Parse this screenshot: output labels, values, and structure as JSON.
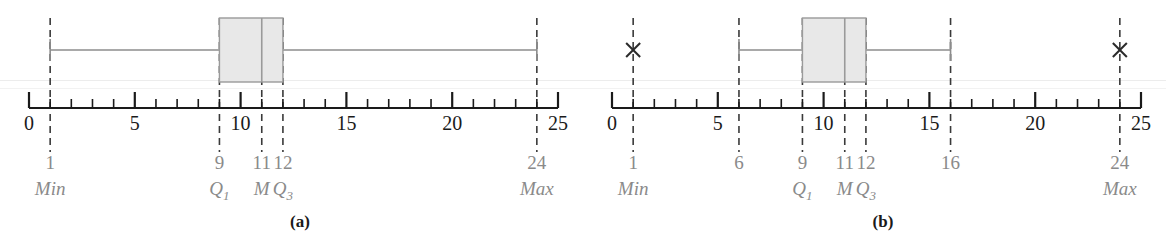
{
  "figure": {
    "type": "boxplot-pair-diagram",
    "panels": [
      {
        "id": "a",
        "caption": "(a)",
        "axis": {
          "min": 0,
          "max": 25,
          "tick_step": 1,
          "major_tick_step": 5,
          "tick_labels": [
            "0",
            "5",
            "10",
            "15",
            "20",
            "25"
          ],
          "tick_label_values": [
            0,
            5,
            10,
            15,
            20,
            25
          ]
        },
        "markers": [
          {
            "value": 1,
            "number_label": "1",
            "name_label": "Min",
            "name_label_html": "Min"
          },
          {
            "value": 9,
            "number_label": "9",
            "name_label": "Q1",
            "name_label_html": "Q<sub>1</sub>"
          },
          {
            "value": 11,
            "number_label": "11",
            "name_label": "M",
            "name_label_html": "M"
          },
          {
            "value": 12,
            "number_label": "12",
            "name_label": "Q3",
            "name_label_html": "Q<sub>3</sub>"
          },
          {
            "value": 24,
            "number_label": "24",
            "name_label": "Max",
            "name_label_html": "Max"
          }
        ],
        "box": {
          "q1": 9,
          "median": 11,
          "q3": 12
        },
        "whiskers": {
          "low": 1,
          "high": 24
        },
        "outliers": []
      },
      {
        "id": "b",
        "caption": "(b)",
        "axis": {
          "min": 0,
          "max": 25,
          "tick_step": 1,
          "major_tick_step": 5,
          "tick_labels": [
            "0",
            "5",
            "10",
            "15",
            "20",
            "25"
          ],
          "tick_label_values": [
            0,
            5,
            10,
            15,
            20,
            25
          ]
        },
        "markers": [
          {
            "value": 1,
            "number_label": "1",
            "name_label": "Min",
            "name_label_html": "Min"
          },
          {
            "value": 6,
            "number_label": "6",
            "name_label": "",
            "name_label_html": ""
          },
          {
            "value": 9,
            "number_label": "9",
            "name_label": "Q1",
            "name_label_html": "Q<sub>1</sub>"
          },
          {
            "value": 11,
            "number_label": "11",
            "name_label": "M",
            "name_label_html": "M"
          },
          {
            "value": 12,
            "number_label": "12",
            "name_label": "Q3",
            "name_label_html": "Q<sub>3</sub>"
          },
          {
            "value": 16,
            "number_label": "16",
            "name_label": "",
            "name_label_html": ""
          },
          {
            "value": 24,
            "number_label": "24",
            "name_label": "Max",
            "name_label_html": "Max"
          }
        ],
        "box": {
          "q1": 9,
          "median": 11,
          "q3": 12
        },
        "whiskers": {
          "low": 6,
          "high": 16
        },
        "outliers": [
          {
            "value": 1,
            "glyph": "x-marker"
          },
          {
            "value": 24,
            "glyph": "x-marker"
          }
        ]
      }
    ]
  },
  "chart_data": {
    "type": "boxplot",
    "title": "",
    "xlabel": "",
    "ylabel": "",
    "xlim": [
      0,
      25
    ],
    "grid": false,
    "legend": "none",
    "series": [
      {
        "name": "(a)",
        "min": 1,
        "q1": 9,
        "median": 11,
        "q3": 12,
        "max": 24,
        "whisker_low": 1,
        "whisker_high": 24,
        "outliers": [],
        "annotations": [
          {
            "value": 1,
            "number": "1",
            "label": "Min"
          },
          {
            "value": 9,
            "number": "9",
            "label": "Q1"
          },
          {
            "value": 11,
            "number": "11",
            "label": "M"
          },
          {
            "value": 12,
            "number": "12",
            "label": "Q3"
          },
          {
            "value": 24,
            "number": "24",
            "label": "Max"
          }
        ]
      },
      {
        "name": "(b)",
        "min": 1,
        "q1": 9,
        "median": 11,
        "q3": 12,
        "max": 24,
        "whisker_low": 6,
        "whisker_high": 16,
        "outliers": [
          1,
          24
        ],
        "annotations": [
          {
            "value": 1,
            "number": "1",
            "label": "Min"
          },
          {
            "value": 6,
            "number": "6",
            "label": ""
          },
          {
            "value": 9,
            "number": "9",
            "label": "Q1"
          },
          {
            "value": 11,
            "number": "11",
            "label": "M"
          },
          {
            "value": 12,
            "number": "12",
            "label": "Q3"
          },
          {
            "value": 16,
            "number": "16",
            "label": ""
          },
          {
            "value": 24,
            "number": "24",
            "label": "Max"
          }
        ]
      }
    ],
    "axis_ticks": [
      0,
      1,
      2,
      3,
      4,
      5,
      6,
      7,
      8,
      9,
      10,
      11,
      12,
      13,
      14,
      15,
      16,
      17,
      18,
      19,
      20,
      21,
      22,
      23,
      24,
      25
    ],
    "axis_tick_labels": [
      "0",
      "5",
      "10",
      "15",
      "20",
      "25"
    ]
  },
  "colors": {
    "axis": "#1a1a1a",
    "box_fill": "#e8e8e8",
    "box_stroke": "#9a9a9a",
    "whisker": "#8c8c8c",
    "dashed": "#3a3a3a",
    "label_gray": "#8a8a8a",
    "axis_number": "#1a1a1a",
    "caption": "#1a1a1a"
  }
}
